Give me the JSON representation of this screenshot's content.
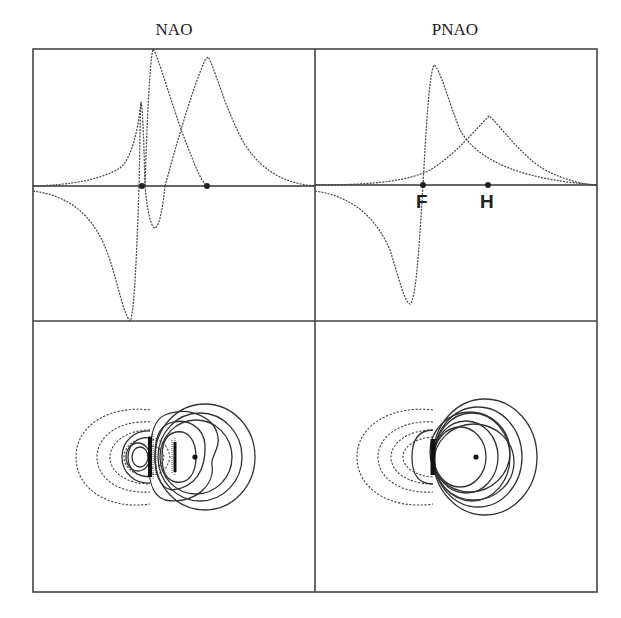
{
  "figure": {
    "columns": [
      {
        "title": "NAO"
      },
      {
        "title": "PNAO"
      }
    ],
    "atom_labels": {
      "F": "F",
      "H": "H"
    },
    "colors": {
      "line": "#333333",
      "frame": "#444444",
      "background": "#ffffff"
    }
  },
  "panels": [
    {
      "id": "nao-profile",
      "row": "top",
      "column": "NAO",
      "type": "orbital-profile-plot",
      "nuclei": [
        "F",
        "H"
      ],
      "curves": 2,
      "style": "dashed"
    },
    {
      "id": "pnao-profile",
      "row": "top",
      "column": "PNAO",
      "type": "orbital-profile-plot",
      "nuclei": [
        "F",
        "H"
      ],
      "curves": 2,
      "style": "dashed",
      "labels_shown": [
        "F",
        "H"
      ]
    },
    {
      "id": "nao-contour",
      "row": "bottom",
      "column": "NAO",
      "type": "contour-plot",
      "positive": "solid",
      "negative": "dashed"
    },
    {
      "id": "pnao-contour",
      "row": "bottom",
      "column": "PNAO",
      "type": "contour-plot",
      "positive": "solid",
      "negative": "dashed"
    }
  ]
}
